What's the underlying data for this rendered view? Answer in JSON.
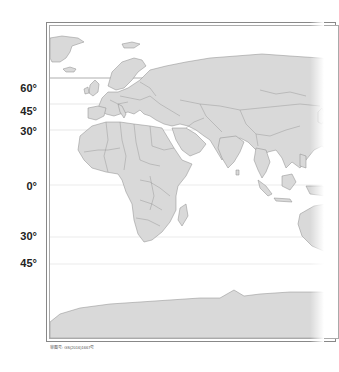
{
  "map": {
    "title": "World map (Eastern Hemisphere, political outline)",
    "land_color": "#d9d9d9",
    "border_color": "#8a8a8a",
    "ocean_color": "#ffffff",
    "latitude_labels": [
      {
        "label": "60°",
        "y": 82
      },
      {
        "label": "45°",
        "y": 105
      },
      {
        "label": "30°",
        "y": 125
      },
      {
        "label": "0°",
        "y": 180
      },
      {
        "label": "30°",
        "y": 230
      },
      {
        "label": "45°",
        "y": 257
      }
    ],
    "latitude_lines": [
      {
        "name": "60N",
        "y": 78,
        "color": "#999999"
      },
      {
        "name": "45N",
        "y": 104,
        "color": "#dddddd"
      },
      {
        "name": "30N",
        "y": 130,
        "color": "#dddddd"
      },
      {
        "name": "0",
        "y": 185,
        "color": "#e2e2e2"
      },
      {
        "name": "30S",
        "y": 237,
        "color": "#e2e2e2"
      },
      {
        "name": "45S",
        "y": 264,
        "color": "#e2e2e2"
      }
    ]
  },
  "caption": "审图号: GS(2016)1667号"
}
